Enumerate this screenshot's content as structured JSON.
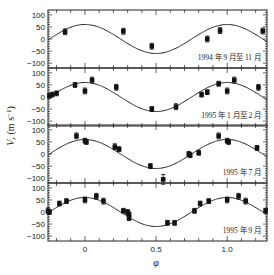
{
  "chart_data": {
    "type": "scatter",
    "title": "",
    "xlabel": "φ",
    "ylabel": "V_r (m s⁻¹)",
    "xlim": [
      -0.26,
      1.28
    ],
    "ylim": [
      -120,
      120
    ],
    "x_ticks": [
      0,
      0.5,
      1.0
    ],
    "x_tick_labels": [
      "0",
      "0.5",
      "1.0"
    ],
    "y_ticks": [
      100,
      50,
      0,
      -50,
      -100
    ],
    "y_tick_labels": [
      "100",
      "50",
      "0",
      "-50",
      "-100"
    ],
    "model_curve": {
      "type": "sine",
      "amplitude": 60,
      "phase_of_max": 0.0,
      "formula": "V = 60·cos(2πφ)"
    },
    "panels": [
      {
        "label": "1994 年 9 月至 11 月",
        "points": [
          {
            "x": -0.14,
            "y": 30,
            "err": 12
          },
          {
            "x": 0.27,
            "y": 32,
            "err": 12
          },
          {
            "x": 0.47,
            "y": -30,
            "err": 12
          },
          {
            "x": 0.86,
            "y": 0,
            "err": 12
          },
          {
            "x": 0.95,
            "y": 35,
            "err": 12
          },
          {
            "x": 1.25,
            "y": 33,
            "err": 12
          }
        ]
      },
      {
        "label": "1995 年 1 月至 2 月",
        "points": [
          {
            "x": -0.25,
            "y": 5,
            "err": 10
          },
          {
            "x": -0.23,
            "y": 10,
            "err": 10
          },
          {
            "x": -0.2,
            "y": 15,
            "err": 10
          },
          {
            "x": -0.07,
            "y": 50,
            "err": 10
          },
          {
            "x": 0.0,
            "y": 25,
            "err": 12
          },
          {
            "x": 0.05,
            "y": 70,
            "err": 12
          },
          {
            "x": 0.22,
            "y": 40,
            "err": 12
          },
          {
            "x": 0.47,
            "y": -50,
            "err": 10
          },
          {
            "x": 0.64,
            "y": -40,
            "err": 12
          },
          {
            "x": 0.82,
            "y": 10,
            "err": 10
          },
          {
            "x": 0.86,
            "y": 20,
            "err": 10
          },
          {
            "x": 0.94,
            "y": 55,
            "err": 10
          },
          {
            "x": 1.0,
            "y": 25,
            "err": 12
          },
          {
            "x": 1.05,
            "y": 70,
            "err": 12
          },
          {
            "x": 1.22,
            "y": 40,
            "err": 12
          }
        ]
      },
      {
        "label": "1995 年 7 月",
        "points": [
          {
            "x": -0.06,
            "y": 75,
            "err": 12
          },
          {
            "x": 0.0,
            "y": 55,
            "err": 10
          },
          {
            "x": 0.01,
            "y": 50,
            "err": 10
          },
          {
            "x": 0.21,
            "y": 30,
            "err": 12
          },
          {
            "x": 0.24,
            "y": 20,
            "err": 10
          },
          {
            "x": 0.46,
            "y": -50,
            "err": 10
          },
          {
            "x": 0.55,
            "y": -105,
            "err": 20
          },
          {
            "x": 0.73,
            "y": 0,
            "err": 10
          },
          {
            "x": 0.74,
            "y": -5,
            "err": 10
          },
          {
            "x": 0.8,
            "y": 5,
            "err": 10
          },
          {
            "x": 0.94,
            "y": 75,
            "err": 12
          },
          {
            "x": 1.0,
            "y": 55,
            "err": 10
          },
          {
            "x": 1.01,
            "y": 50,
            "err": 10
          },
          {
            "x": 1.21,
            "y": 25,
            "err": 10
          }
        ]
      },
      {
        "label": "1995 年 9 月",
        "points": [
          {
            "x": -0.26,
            "y": 5,
            "err": 12
          },
          {
            "x": -0.25,
            "y": 0,
            "err": 10
          },
          {
            "x": -0.18,
            "y": 35,
            "err": 10
          },
          {
            "x": -0.13,
            "y": 45,
            "err": 10
          },
          {
            "x": 0.0,
            "y": 50,
            "err": 12
          },
          {
            "x": 0.08,
            "y": 65,
            "err": 12
          },
          {
            "x": 0.13,
            "y": 45,
            "err": 12
          },
          {
            "x": 0.27,
            "y": 5,
            "err": 10
          },
          {
            "x": 0.3,
            "y": 0,
            "err": 10
          },
          {
            "x": 0.31,
            "y": -10,
            "err": 10
          },
          {
            "x": 0.31,
            "y": -25,
            "err": 10
          },
          {
            "x": 0.58,
            "y": -45,
            "err": 10
          },
          {
            "x": 0.63,
            "y": -45,
            "err": 10
          },
          {
            "x": 0.77,
            "y": 5,
            "err": 10
          },
          {
            "x": 0.81,
            "y": 35,
            "err": 10
          },
          {
            "x": 0.87,
            "y": 45,
            "err": 10
          },
          {
            "x": 1.0,
            "y": 50,
            "err": 12
          },
          {
            "x": 1.08,
            "y": 65,
            "err": 12
          },
          {
            "x": 1.13,
            "y": 45,
            "err": 12
          },
          {
            "x": 1.27,
            "y": 5,
            "err": 10
          }
        ]
      }
    ]
  }
}
